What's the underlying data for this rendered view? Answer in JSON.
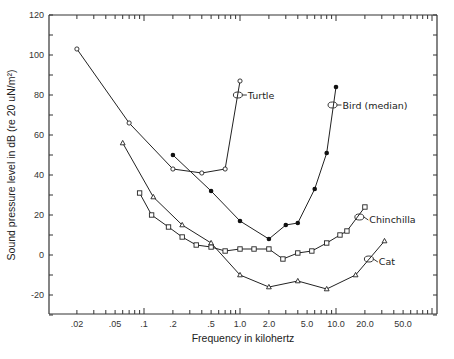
{
  "chart_data": {
    "type": "line",
    "title": "",
    "xlabel": "Frequency in kilohertz",
    "ylabel": "Sound pressure level in dB (re 20 uN/m²)",
    "xscale": "log",
    "xlim": [
      0.01,
      1000
    ],
    "ylim": [
      -30,
      120
    ],
    "x_ticks": [
      {
        "value": 0.02,
        "label": ".02"
      },
      {
        "value": 0.05,
        "label": ".05"
      },
      {
        "value": 0.1,
        "label": ".1"
      },
      {
        "value": 0.2,
        "label": ".2"
      },
      {
        "value": 0.5,
        "label": ".5"
      },
      {
        "value": 1.0,
        "label": "1.0"
      },
      {
        "value": 2.0,
        "label": "2.0"
      },
      {
        "value": 5.0,
        "label": "5.0"
      },
      {
        "value": 10.0,
        "label": "10.0"
      },
      {
        "value": 20.0,
        "label": "20.0"
      },
      {
        "value": 50.0,
        "label": "50.0"
      }
    ],
    "y_ticks": [
      {
        "value": 120,
        "label": "120"
      },
      {
        "value": 100,
        "label": "100"
      },
      {
        "value": 80,
        "label": "80"
      },
      {
        "value": 60,
        "label": "60"
      },
      {
        "value": 40,
        "label": "40"
      },
      {
        "value": 20,
        "label": "20"
      },
      {
        "value": 0,
        "label": "0"
      },
      {
        "value": -20,
        "label": "-20"
      }
    ],
    "grid": false,
    "legend": "none (inline labels)",
    "series": [
      {
        "name": "Turtle",
        "marker": "open-circle",
        "x": [
          0.02,
          0.07,
          0.2,
          0.4,
          0.7,
          1.0
        ],
        "y": [
          103,
          66,
          43,
          41,
          43,
          87
        ],
        "label_at": {
          "x": 0.95,
          "y": 80
        }
      },
      {
        "name": "Bird (median)",
        "marker": "filled-circle",
        "x": [
          0.2,
          0.5,
          1.0,
          2.0,
          3.0,
          4.0,
          6.0,
          8.0,
          10.0
        ],
        "y": [
          50,
          32,
          17,
          8,
          15,
          16,
          33,
          51,
          84
        ],
        "label_at": {
          "x": 9.2,
          "y": 75
        }
      },
      {
        "name": "Chinchilla",
        "marker": "open-square",
        "x": [
          0.09,
          0.12,
          0.18,
          0.25,
          0.35,
          0.5,
          0.7,
          1.0,
          1.4,
          2.0,
          2.8,
          4.0,
          5.6,
          8.0,
          11.0,
          13.0,
          20.0
        ],
        "y": [
          31,
          20,
          14,
          9,
          5,
          4,
          2,
          3,
          3,
          3,
          -2,
          1,
          2,
          6,
          10,
          12,
          24
        ],
        "label_at": {
          "x": 17.5,
          "y": 19
        }
      },
      {
        "name": "Cat",
        "marker": "open-triangle",
        "x": [
          0.06,
          0.125,
          0.25,
          0.5,
          1.0,
          2.0,
          4.0,
          8.0,
          16.0,
          32.0
        ],
        "y": [
          56,
          29,
          15,
          6,
          -10,
          -16,
          -13,
          -17,
          -10,
          7
        ],
        "label_at": {
          "x": 22.0,
          "y": -2
        }
      }
    ]
  }
}
